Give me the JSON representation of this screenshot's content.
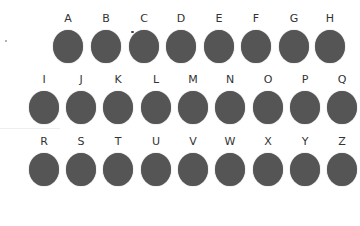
{
  "rows": [
    {
      "letters": [
        "A",
        "B",
        "C",
        "D",
        "E",
        "F",
        "G",
        "H"
      ],
      "x": [
        52,
        90,
        128,
        165,
        203,
        240,
        278,
        314
      ],
      "y": 12
    },
    {
      "letters": [
        "I",
        "J",
        "K",
        "L",
        "M",
        "N",
        "O",
        "P",
        "Q"
      ],
      "x": [
        28,
        65,
        102,
        140,
        177,
        214,
        252,
        289,
        326
      ],
      "y": 73
    },
    {
      "letters": [
        "R",
        "S",
        "T",
        "U",
        "V",
        "W",
        "X",
        "Y",
        "Z"
      ],
      "x": [
        28,
        65,
        102,
        140,
        177,
        214,
        252,
        289,
        326
      ],
      "y": 135
    }
  ],
  "colors": {
    "dot": "#555555",
    "letter": "#333333"
  }
}
